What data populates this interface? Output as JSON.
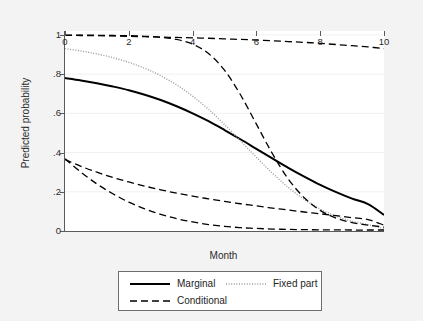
{
  "chart_data": {
    "type": "line",
    "title": "",
    "subtitle": "",
    "xlabel": "Month",
    "ylabel": "Predicted probability",
    "xlim": [
      0,
      10
    ],
    "ylim": [
      0,
      1.02
    ],
    "xticks": [
      0,
      2,
      4,
      6,
      8,
      10
    ],
    "xtick_labels": [
      "0",
      "2",
      "4",
      "6",
      "8",
      "10"
    ],
    "yticks": [
      0,
      0.2,
      0.4,
      0.6,
      0.8,
      1
    ],
    "ytick_labels": [
      "0",
      ".2",
      ".4",
      ".6",
      ".8",
      "1"
    ],
    "grid": "horizontal-faint",
    "legend_position": "below-plot",
    "background_color": "#f3f3f3",
    "plot_background_color": "#ffffff",
    "axis_color": "#5a5a5a",
    "line_color": "#000000",
    "dotted_color": "#9a9a9a",
    "x": [
      0,
      0.5,
      1,
      1.5,
      2,
      2.5,
      3,
      3.5,
      4,
      4.5,
      5,
      5.5,
      6,
      6.5,
      7,
      7.5,
      8,
      8.5,
      9,
      9.5,
      10
    ],
    "series": [
      {
        "name": "Marginal",
        "style": "solid",
        "width": 2.0,
        "color": "#000000",
        "values": [
          0.78,
          0.768,
          0.754,
          0.737,
          0.718,
          0.695,
          0.668,
          0.636,
          0.6,
          0.56,
          0.515,
          0.468,
          0.419,
          0.37,
          0.322,
          0.277,
          0.235,
          0.198,
          0.165,
          0.137,
          0.082
        ]
      },
      {
        "name": "Fixed part",
        "style": "dotted",
        "width": 1.4,
        "color": "#9a9a9a",
        "values": [
          0.93,
          0.918,
          0.903,
          0.884,
          0.86,
          0.83,
          0.792,
          0.745,
          0.688,
          0.62,
          0.543,
          0.46,
          0.376,
          0.295,
          0.222,
          0.161,
          0.112,
          0.076,
          0.05,
          0.032,
          0.012
        ]
      },
      {
        "name": "Conditional",
        "label_shown": true,
        "style": "dashed",
        "width": 1.3,
        "color": "#000000",
        "sublines": [
          {
            "id": "conditional-upper-flat",
            "values": [
              0.998,
              0.997,
              0.996,
              0.995,
              0.993,
              0.991,
              0.989,
              0.987,
              0.985,
              0.983,
              0.98,
              0.977,
              0.974,
              0.97,
              0.966,
              0.962,
              0.957,
              0.951,
              0.945,
              0.939,
              0.93
            ]
          },
          {
            "id": "conditional-upper-steep",
            "values": [
              0.999,
              0.999,
              0.998,
              0.997,
              0.996,
              0.993,
              0.988,
              0.977,
              0.953,
              0.905,
              0.82,
              0.695,
              0.545,
              0.395,
              0.265,
              0.17,
              0.105,
              0.066,
              0.043,
              0.03,
              0.02
            ]
          },
          {
            "id": "conditional-lower-slow",
            "values": [
              0.365,
              0.33,
              0.3,
              0.273,
              0.25,
              0.229,
              0.21,
              0.193,
              0.178,
              0.164,
              0.151,
              0.139,
              0.128,
              0.117,
              0.107,
              0.097,
              0.088,
              0.078,
              0.068,
              0.058,
              0.03
            ]
          },
          {
            "id": "conditional-lower-fast",
            "values": [
              0.368,
              0.3,
              0.24,
              0.19,
              0.147,
              0.113,
              0.085,
              0.063,
              0.046,
              0.033,
              0.024,
              0.017,
              0.013,
              0.01,
              0.008,
              0.007,
              0.006,
              0.006,
              0.005,
              0.005,
              0.005
            ]
          }
        ]
      }
    ],
    "legend_entries": [
      {
        "label": "Marginal",
        "style": "solid"
      },
      {
        "label": "Fixed part",
        "style": "dotted"
      },
      {
        "label": "Conditional",
        "style": "dashed"
      }
    ]
  }
}
